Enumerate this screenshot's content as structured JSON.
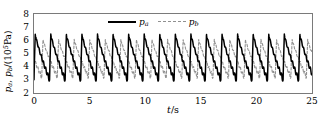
{
  "figure": {
    "background_color": "#ffffff",
    "frame_color": "#7a7a7a"
  },
  "axes": {
    "ylabel_prefix": "p",
    "ylabel_sub_a": "a",
    "ylabel_comma": ", ",
    "ylabel_prefix2": "p",
    "ylabel_sub_b": "b",
    "ylabel_unit_open": "/(10",
    "ylabel_exponent": "5",
    "ylabel_unit_close": "Pa)",
    "xlabel_var": "t",
    "xlabel_unit": "/s"
  },
  "legend": {
    "position": "top-center-inside",
    "entries": [
      {
        "label_var": "p",
        "label_sub": "a",
        "style": "solid",
        "color": "#000000"
      },
      {
        "label_var": "p",
        "label_sub": "b",
        "style": "dashed",
        "color": "#909090"
      }
    ]
  },
  "chart_data": {
    "type": "line",
    "title": "",
    "subtitle": "",
    "xlabel": "t/s",
    "ylabel": "p_a, p_b/(10^5 Pa)",
    "xlim": [
      0,
      25
    ],
    "ylim": [
      2,
      8
    ],
    "xticks": [
      0,
      5,
      10,
      15,
      20,
      25
    ],
    "yticks": [
      2,
      3,
      4,
      5,
      6,
      7,
      8
    ],
    "xtick_labels": [
      "0",
      "5",
      "10",
      "15",
      "20",
      "25"
    ],
    "ytick_labels": [
      "2",
      "3",
      "4",
      "5",
      "6",
      "7",
      "8"
    ],
    "grid": false,
    "legend_position": "upper center",
    "period_seconds": 1.4,
    "num_cycles": 18,
    "series": [
      {
        "name": "p_a",
        "style": "solid",
        "color": "#000000",
        "linewidth": 1.5,
        "description": "Sawtooth pressure wave: rapid rise to peak then slow decay with high-frequency ripple, repeating each period.",
        "peak_value": 6.5,
        "trough_value": 3.0,
        "mean_value": 4.75,
        "waveform": {
          "rise_fraction": 0.08,
          "decay_fraction": 0.92,
          "ripple_amplitude": 0.35,
          "ripple_cycles_per_period": 7
        }
      },
      {
        "name": "p_b",
        "style": "dashed",
        "color": "#909090",
        "linewidth": 1.1,
        "description": "Anti-phase counterpart of p_a: rises slowly while p_a decays, drops sharply when p_a jumps.",
        "peak_value": 6.1,
        "trough_value": 3.2,
        "mean_value": 4.65,
        "phase_offset_fraction": 0.5,
        "waveform": {
          "rise_fraction": 0.08,
          "decay_fraction": 0.92,
          "ripple_amplitude": 0.3,
          "ripple_cycles_per_period": 7
        }
      }
    ]
  }
}
